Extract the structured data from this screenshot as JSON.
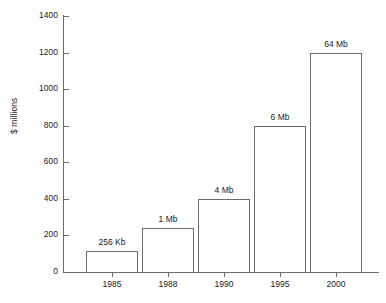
{
  "chart_data": {
    "type": "bar",
    "title": "",
    "xlabel": "",
    "ylabel": "$ millions",
    "ylim": [
      0,
      1400
    ],
    "ytick_values": [
      0,
      200,
      400,
      600,
      800,
      1000,
      1200,
      1400
    ],
    "ytick_labels": [
      "0",
      "200",
      "400",
      "600",
      "800",
      "1000",
      "1200",
      "1400"
    ],
    "grid": false,
    "legend": "none",
    "categories": [
      "1985",
      "1988",
      "1990",
      "1995",
      "2000"
    ],
    "values": [
      115,
      240,
      400,
      800,
      1200
    ],
    "bar_labels": [
      "256 Kb",
      "1 Mb",
      "4 Mb",
      "6 Mb",
      "64 Mb"
    ],
    "bars": [
      {
        "category": "1985",
        "value": 115,
        "label": "256 Kb"
      },
      {
        "category": "1988",
        "value": 240,
        "label": "1 Mb"
      },
      {
        "category": "1990",
        "value": 400,
        "label": "4 Mb"
      },
      {
        "category": "1995",
        "value": 800,
        "label": "6 Mb"
      },
      {
        "category": "2000",
        "value": 1200,
        "label": "64 Mb"
      }
    ],
    "colors": {
      "background": "#ffffff",
      "bar_fill": "#ffffff",
      "bar_stroke": "#6b6b6b",
      "axis": "#6b6b6b",
      "text": "#1a1a1a"
    }
  }
}
